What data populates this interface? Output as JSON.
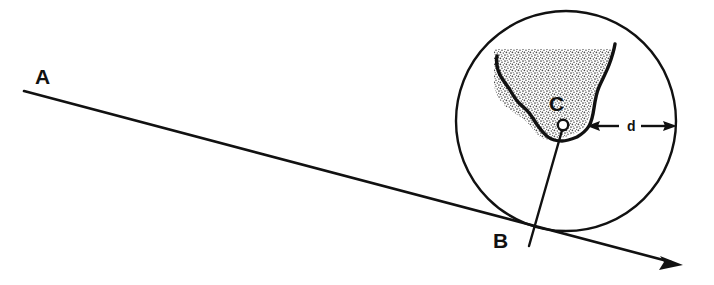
{
  "figure": {
    "type": "technical-line-diagram",
    "background_color": "#ffffff",
    "ink_color": "#111111",
    "width": 714,
    "height": 285,
    "labels": {
      "point_a": "A",
      "point_b": "B",
      "region_c": "C",
      "distance_d": "d"
    },
    "elements": {
      "trajectory_line_name": "trajectory-line-a-to-b",
      "magnifier_circle_name": "magnifier-circle",
      "stippled_region_name": "stippled-region-c",
      "site_marker_name": "site-marker",
      "dimension_arrows_name": "dimension-d-arrows",
      "oblique_line_name": "oblique-line-through-b"
    },
    "geometry": {
      "trajectory_start": [
        24,
        91
      ],
      "trajectory_end": [
        683,
        265
      ],
      "arrowhead_at": "trajectory_end",
      "circle_center": [
        566,
        121
      ],
      "circle_radius": 110,
      "marker_center": [
        563,
        125
      ],
      "marker_radius": 5,
      "dimension_left_arrow_tip": [
        588,
        126
      ],
      "dimension_right_arrow_tip": [
        676,
        126
      ],
      "oblique_line_start": [
        563,
        127
      ],
      "oblique_line_end": [
        529,
        246
      ]
    },
    "label_positions": {
      "point_a": [
        35,
        84
      ],
      "point_b": [
        493,
        248
      ],
      "region_c": [
        549,
        111
      ],
      "distance_d": [
        630,
        131
      ]
    }
  }
}
